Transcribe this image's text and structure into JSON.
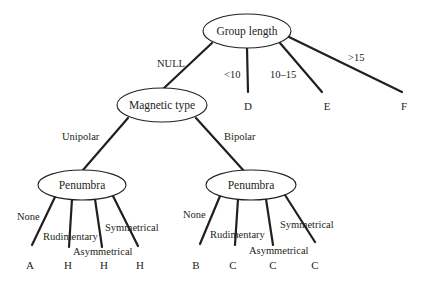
{
  "diagram": {
    "type": "decision-tree",
    "nodes": {
      "root": {
        "label": "Group length"
      },
      "magnetic": {
        "label": "Magnetic type"
      },
      "penumbra_left": {
        "label": "Penumbra"
      },
      "penumbra_right": {
        "label": "Penumbra"
      }
    },
    "root_edges": [
      {
        "label": "NULL",
        "target": "Magnetic type"
      },
      {
        "label": "<10",
        "target": "D"
      },
      {
        "label": "10–15",
        "target": "E"
      },
      {
        "label": ">15",
        "target": "F"
      }
    ],
    "magnetic_edges": [
      {
        "label": "Unipolar",
        "target": "Penumbra"
      },
      {
        "label": "Bipolar",
        "target": "Penumbra"
      }
    ],
    "left_penumbra_edges": [
      {
        "label": "None",
        "target": "A"
      },
      {
        "label": "Rudimentary",
        "target": "H"
      },
      {
        "label": "Asymmetrical",
        "target": "H"
      },
      {
        "label": "Symmetrical",
        "target": "H"
      }
    ],
    "right_penumbra_edges": [
      {
        "label": "None",
        "target": "B"
      },
      {
        "label": "Rudimentary",
        "target": "C"
      },
      {
        "label": "Asymmetrical",
        "target": "C"
      },
      {
        "label": "Symmetrical",
        "target": "C"
      }
    ]
  }
}
